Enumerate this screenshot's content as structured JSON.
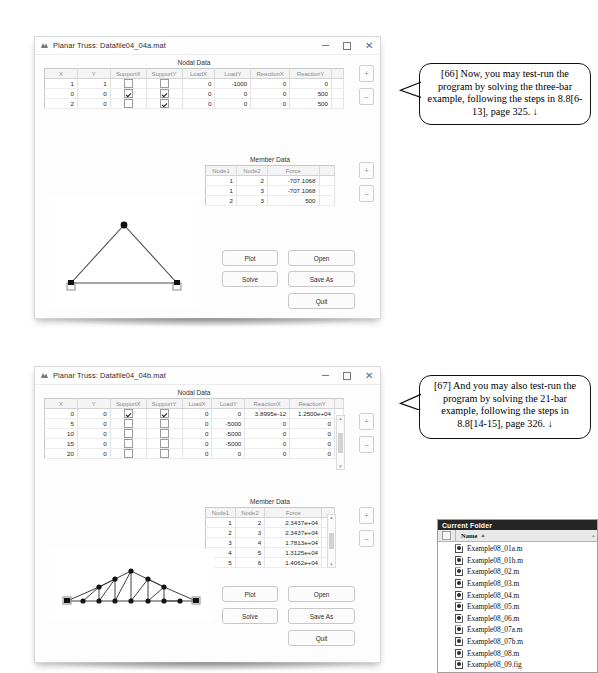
{
  "windows": [
    {
      "title": "Planar Truss: Datafile04_04a.mat",
      "titlebar": {
        "minimize_label": "–",
        "maximize_label": "□",
        "close_label": "✕",
        "app_icon": "matlab-figure-icon"
      },
      "nodal": {
        "caption": "Nodal Data",
        "columns": [
          "X",
          "Y",
          "SupportX",
          "SupportY",
          "LoadX",
          "LoadY",
          "ReactionX",
          "ReactionY"
        ],
        "rows": [
          {
            "x": "1",
            "y": "1",
            "supportx": false,
            "supporty": false,
            "loadx": "0",
            "loady": "-1000",
            "reactionx": "0",
            "reactiony": "0"
          },
          {
            "x": "0",
            "y": "0",
            "supportx": true,
            "supporty": true,
            "loadx": "0",
            "loady": "0",
            "reactionx": "0",
            "reactiony": "500"
          },
          {
            "x": "2",
            "y": "0",
            "supportx": false,
            "supporty": true,
            "loadx": "0",
            "loady": "0",
            "reactionx": "0",
            "reactiony": "500"
          }
        ]
      },
      "member": {
        "caption": "Member Data",
        "columns": [
          "Node1",
          "Node2",
          "Force"
        ],
        "rows": [
          {
            "node1": "1",
            "node2": "2",
            "force": "-707.1068"
          },
          {
            "node1": "1",
            "node2": "3",
            "force": "-707.1068"
          },
          {
            "node1": "2",
            "node2": "3",
            "force": "500"
          }
        ]
      },
      "buttons": {
        "plot": "Plot",
        "solve": "Solve",
        "open": "Open",
        "save_as": "Save As",
        "quit": "Quit"
      },
      "stepper": {
        "plus": "+",
        "minus": "–"
      }
    },
    {
      "title": "Planar Truss: Datafile04_04b.mat",
      "titlebar": {
        "minimize_label": "–",
        "maximize_label": "□",
        "close_label": "✕",
        "app_icon": "matlab-figure-icon"
      },
      "nodal": {
        "caption": "Nodal Data",
        "columns": [
          "X",
          "Y",
          "SupportX",
          "SupportY",
          "LoadX",
          "LoadY",
          "ReactionX",
          "ReactionY"
        ],
        "rows": [
          {
            "x": "0",
            "y": "0",
            "supportx": true,
            "supporty": true,
            "loadx": "0",
            "loady": "0",
            "reactionx": "3.8995e-12",
            "reactiony": "1.2500e+04"
          },
          {
            "x": "5",
            "y": "0",
            "supportx": false,
            "supporty": false,
            "loadx": "0",
            "loady": "-5000",
            "reactionx": "0",
            "reactiony": "0"
          },
          {
            "x": "10",
            "y": "0",
            "supportx": false,
            "supporty": false,
            "loadx": "0",
            "loady": "-5000",
            "reactionx": "0",
            "reactiony": "0"
          },
          {
            "x": "15",
            "y": "0",
            "supportx": false,
            "supporty": false,
            "loadx": "0",
            "loady": "-5000",
            "reactionx": "0",
            "reactiony": "0"
          },
          {
            "x": "20",
            "y": "0",
            "supportx": false,
            "supporty": false,
            "loadx": "0",
            "loady": "0",
            "reactionx": "0",
            "reactiony": "0"
          }
        ]
      },
      "member": {
        "caption": "Member Data",
        "columns": [
          "Node1",
          "Node2",
          "Force"
        ],
        "rows": [
          {
            "node1": "1",
            "node2": "2",
            "force": "2.3437e+04"
          },
          {
            "node1": "2",
            "node2": "3",
            "force": "2.3437e+04"
          },
          {
            "node1": "3",
            "node2": "4",
            "force": "1.7813e+04"
          },
          {
            "node1": "4",
            "node2": "5",
            "force": "1.3125e+04"
          },
          {
            "node1": "5",
            "node2": "6",
            "force": "1.4062e+04"
          }
        ]
      },
      "buttons": {
        "plot": "Plot",
        "solve": "Solve",
        "open": "Open",
        "save_as": "Save As",
        "quit": "Quit"
      },
      "stepper": {
        "plus": "+",
        "minus": "–"
      }
    }
  ],
  "callouts": [
    {
      "id": "66",
      "text": "[66] Now, you may test-run the program by solving the three-bar example, following the steps in 8.8[6-13], page 325. ↓"
    },
    {
      "id": "67",
      "text": "[67] And you may also test-run the program by solving the 21-bar example, following the steps in 8.8[14-15], page 326. ↓"
    }
  ],
  "current_folder": {
    "header": "Current Folder",
    "name_column": "Name",
    "sort_arrow": "▲",
    "files": [
      "Example08_01a.m",
      "Example08_01b.m",
      "Example08_02.m",
      "Example08_03.m",
      "Example08_04.m",
      "Example08_05.m",
      "Example08_06.m",
      "Example08_07a.m",
      "Example08_07b.m",
      "Example08_08.m",
      "Example08_09.fig"
    ]
  }
}
